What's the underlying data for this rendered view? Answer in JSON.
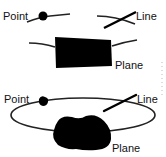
{
  "diagrams": [
    {
      "id": "top",
      "labels": {
        "point": "Point",
        "line": "Line",
        "plane": "Plane"
      },
      "plane_shape": "rectangle"
    },
    {
      "id": "bottom",
      "labels": {
        "point": "Point",
        "line": "Line",
        "plane": "Plane"
      },
      "plane_shape": "blob"
    }
  ],
  "colors": {
    "ink": "#000000",
    "background": "#ffffff",
    "dotted_mark": "#bbbbbb"
  }
}
